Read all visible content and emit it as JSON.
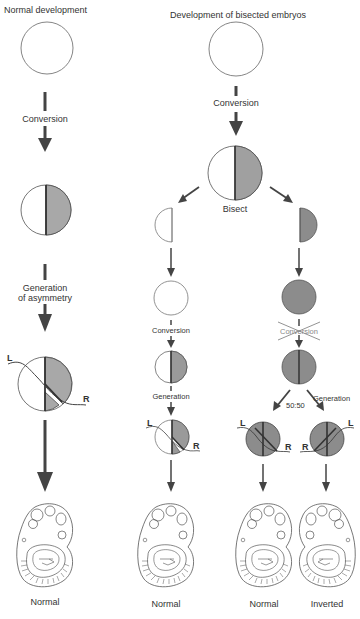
{
  "titles": {
    "left": "Normal development",
    "right": "Development of bisected embryos"
  },
  "left_column": {
    "steps": [
      {
        "label": "Conversion"
      },
      {
        "label_line1": "Generation",
        "label_line2": "of asymmetry"
      }
    ],
    "markers": {
      "left": "L",
      "right": "R"
    },
    "outcome": "Normal"
  },
  "right_column": {
    "top_conversion": "Conversion",
    "bisect": "Bisect",
    "left_branch": {
      "conversion": "Conversion",
      "generation": "Generation",
      "markers": {
        "left": "L",
        "right": "R"
      },
      "outcome": "Normal"
    },
    "right_branch": {
      "conversion_crossed": "Conversion",
      "ratio": "50:50",
      "generation": "Generation",
      "left_embryo": {
        "markers": {
          "left": "L",
          "right": "R"
        },
        "outcome": "Normal"
      },
      "right_embryo": {
        "markers": {
          "left": "L",
          "right": "R"
        },
        "outcome": "Inverted"
      }
    }
  },
  "colors": {
    "shade": "#a8a8a8",
    "dark_shade": "#8c8c8c",
    "arrow": "#444444",
    "outline": "#555555"
  }
}
